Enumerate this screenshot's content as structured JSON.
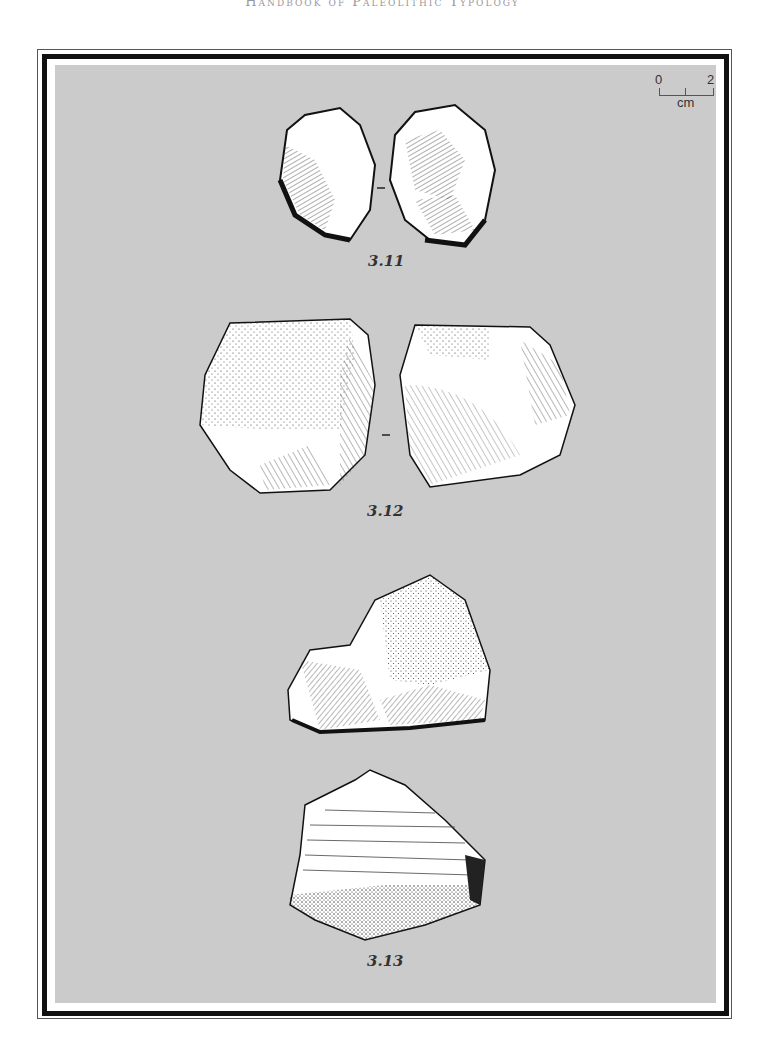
{
  "running_head": "Handbook of Paleolithic Typology",
  "scale_bar": {
    "start": "0",
    "end": "2",
    "unit": "cm"
  },
  "figures": [
    {
      "id": "3.11",
      "label": "3.11",
      "views": 2
    },
    {
      "id": "3.12",
      "label": "3.12",
      "views": 2
    },
    {
      "id": "3.13",
      "label": "3.13",
      "views": 2
    }
  ],
  "colors": {
    "panel": "#cbcbcb",
    "frame": "#111111",
    "ink": "#222222"
  }
}
